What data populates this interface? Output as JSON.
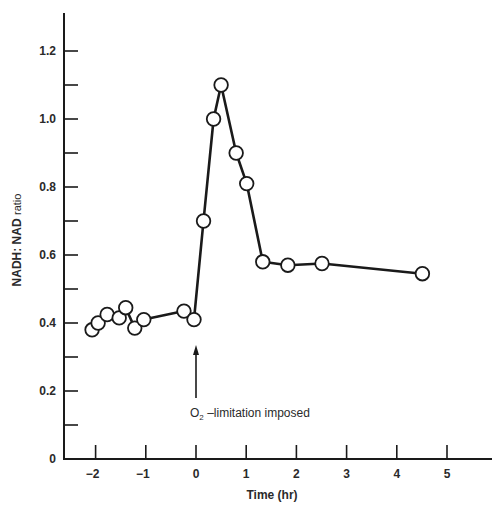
{
  "chart_data": {
    "type": "line",
    "title": "",
    "xlabel": "Time (hr)",
    "ylabel": "NADH: NAD ratio",
    "ylabel_main": "NADH: NAD",
    "ylabel_sub": "ratio",
    "xlim": [
      -2.6,
      5.9
    ],
    "ylim": [
      0,
      1.3
    ],
    "grid": false,
    "legend": null,
    "x_ticks": [
      -2,
      -1,
      0,
      1,
      2,
      3,
      4,
      5
    ],
    "x_tick_labels": [
      "−2",
      "−1",
      "0",
      "1",
      "2",
      "3",
      "4",
      "5"
    ],
    "y_ticks_major": [
      0,
      0.2,
      0.4,
      0.6,
      0.8,
      1.0,
      1.2
    ],
    "y_tick_labels": [
      "0",
      "0.2",
      "0.4",
      "0.6",
      "0.8",
      "1.0",
      "1.2"
    ],
    "y_ticks_minor": [
      0.1,
      0.3,
      0.5,
      0.7,
      0.9,
      1.1
    ],
    "series": [
      {
        "name": "NADH:NAD ratio",
        "marker": "open-circle",
        "x": [
          -2.07,
          -1.95,
          -1.77,
          -1.53,
          -1.4,
          -1.22,
          -1.04,
          -0.24,
          -0.04,
          0.15,
          0.35,
          0.5,
          0.8,
          1.01,
          1.33,
          1.83,
          2.51,
          4.51
        ],
        "y": [
          0.38,
          0.4,
          0.425,
          0.415,
          0.445,
          0.385,
          0.41,
          0.435,
          0.41,
          0.7,
          1.0,
          1.1,
          0.9,
          0.81,
          0.58,
          0.57,
          0.575,
          0.545
        ]
      }
    ],
    "annotations": [
      {
        "type": "arrow",
        "x": 0,
        "y_from": 0.18,
        "y_to": 0.33,
        "text_main": "O",
        "text_sub": "2",
        "text_rest": " –limitation imposed",
        "text": "O₂ –limitation imposed"
      }
    ]
  }
}
